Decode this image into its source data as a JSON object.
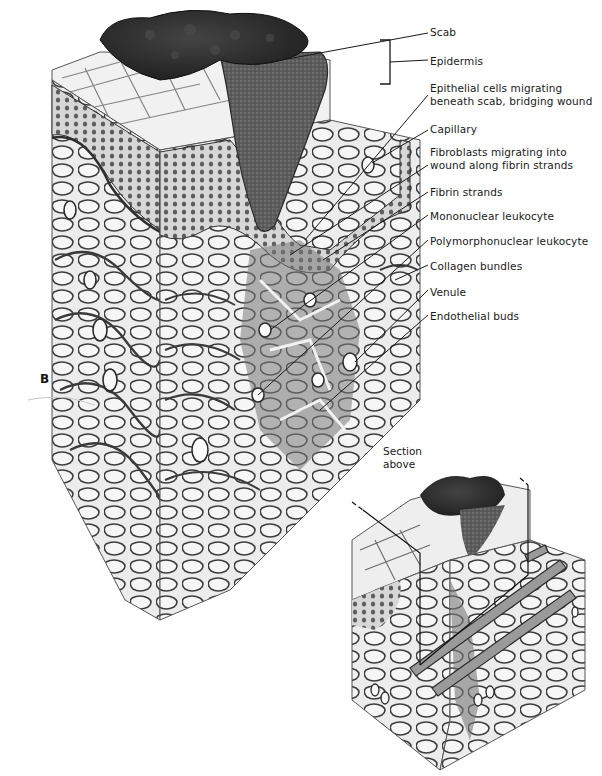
{
  "figure": {
    "panel_letter": "B",
    "labels": [
      {
        "text": "Scab",
        "x": 430,
        "y": 26
      },
      {
        "text": "Epidermis",
        "x": 430,
        "y": 55
      },
      {
        "text": "Epithelial cells migrating",
        "x": 430,
        "y": 82
      },
      {
        "text": "beneath scab, bridging wound",
        "x": 430,
        "y": 95
      },
      {
        "text": "Capillary",
        "x": 430,
        "y": 123
      },
      {
        "text": "Fibroblasts migrating into",
        "x": 430,
        "y": 146
      },
      {
        "text": "wound along fibrin strands",
        "x": 430,
        "y": 159
      },
      {
        "text": "Fibrin strands",
        "x": 430,
        "y": 186
      },
      {
        "text": "Mononuclear leukocyte",
        "x": 430,
        "y": 210
      },
      {
        "text": "Polymorphonuclear leukocyte",
        "x": 430,
        "y": 235
      },
      {
        "text": "Collagen bundles",
        "x": 430,
        "y": 260
      },
      {
        "text": "Venule",
        "x": 430,
        "y": 286
      },
      {
        "text": "Endothelial buds",
        "x": 430,
        "y": 310
      }
    ],
    "inset": {
      "label_line1": "Section",
      "label_line2": "above"
    }
  },
  "colors": {
    "ink": "#1a1a1a",
    "scab": "#2b2b2b",
    "wound_fill": "#5a5a5a",
    "tissue_light": "#e8e8e8",
    "tissue_mid": "#bdbdbd",
    "tissue_dark": "#6b6b6b"
  }
}
